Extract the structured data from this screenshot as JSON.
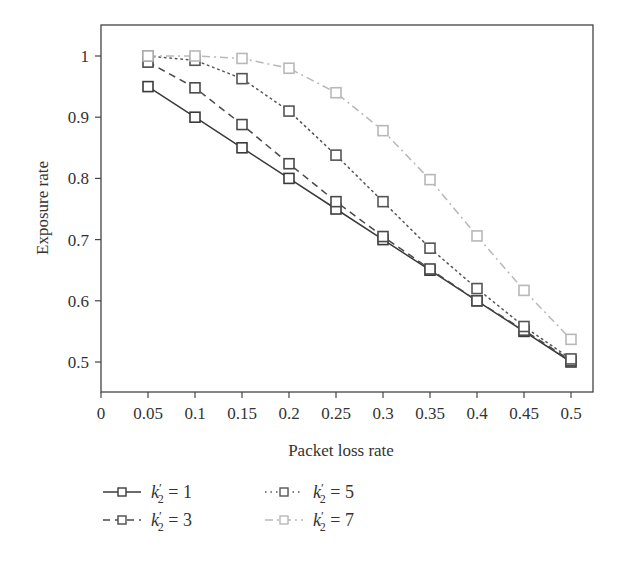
{
  "chart_data": {
    "type": "line",
    "title": "",
    "xlabel": "Packet loss rate",
    "ylabel": "Exposure rate",
    "xlim": [
      0,
      0.525
    ],
    "ylim": [
      0.45,
      1.05
    ],
    "xticks": [
      0,
      0.05,
      0.1,
      0.15,
      0.2,
      0.25,
      0.3,
      0.35,
      0.4,
      0.45,
      0.5
    ],
    "xtick_labels": [
      "0",
      "0.05",
      "0.1",
      "0.15",
      "0.2",
      "0.25",
      "0.3",
      "0.35",
      "0.4",
      "0.45",
      "0.5"
    ],
    "yticks": [
      0.5,
      0.6,
      0.7,
      0.8,
      0.9,
      1.0
    ],
    "ytick_labels": [
      "0.5",
      "0.6",
      "0.7",
      "0.8",
      "0.9",
      "1"
    ],
    "grid": false,
    "legend_position": "bottom",
    "x": [
      0.05,
      0.1,
      0.15,
      0.2,
      0.25,
      0.3,
      0.35,
      0.4,
      0.45,
      0.5
    ],
    "series": [
      {
        "name": "k2' = 1",
        "label_var": "k",
        "label_sub": "2",
        "label_value": "1",
        "style": "solid",
        "color": "#3a3a3a",
        "marker": "square",
        "values": [
          0.95,
          0.9,
          0.85,
          0.8,
          0.75,
          0.7,
          0.65,
          0.6,
          0.55,
          0.5
        ]
      },
      {
        "name": "k2' = 3",
        "label_var": "k",
        "label_sub": "2",
        "label_value": "3",
        "style": "dashed",
        "color": "#4a4a4a",
        "marker": "square",
        "values": [
          0.99,
          0.948,
          0.888,
          0.824,
          0.762,
          0.705,
          0.652,
          0.6,
          0.552,
          0.502
        ]
      },
      {
        "name": "k2' = 5",
        "label_var": "k",
        "label_sub": "2",
        "label_value": "5",
        "style": "dotted",
        "color": "#555555",
        "marker": "square",
        "values": [
          1.0,
          0.993,
          0.963,
          0.91,
          0.838,
          0.762,
          0.686,
          0.62,
          0.558,
          0.505
        ]
      },
      {
        "name": "k2' = 7",
        "label_var": "k",
        "label_sub": "2",
        "label_value": "7",
        "style": "dashdot",
        "color": "#b8b8b8",
        "marker": "square",
        "values": [
          1.0,
          1.0,
          0.996,
          0.98,
          0.94,
          0.878,
          0.798,
          0.706,
          0.617,
          0.537
        ]
      }
    ]
  }
}
